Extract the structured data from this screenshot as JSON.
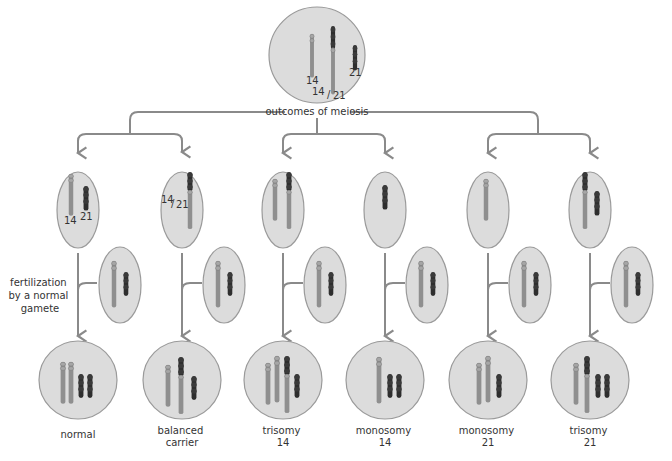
{
  "title_label": "outcomes of meiosis",
  "fertilization_label": [
    "fertilization",
    "by a normal",
    "gamete"
  ],
  "colors": {
    "cell_fill": "#dcdcdc",
    "cell_stroke": "#9a9a9a",
    "line": "#8a8a8a",
    "chrom14": "#8f8f8f",
    "chrom21": "#2e2e2e",
    "text": "#333333"
  },
  "parent_cell": {
    "labels": {
      "c14": "14",
      "c1421_a": "14",
      "c1421_b": "21",
      "c21": "21"
    }
  },
  "gametes": [
    {
      "id": "g1",
      "labels": [
        "14",
        "21"
      ]
    },
    {
      "id": "g2",
      "labels": [
        "14",
        "21"
      ]
    },
    {
      "id": "g3",
      "labels": []
    },
    {
      "id": "g4",
      "labels": []
    },
    {
      "id": "g5",
      "labels": []
    },
    {
      "id": "g6",
      "labels": []
    }
  ],
  "outcomes": [
    {
      "id": "normal",
      "line1": "normal",
      "line2": ""
    },
    {
      "id": "balanced-carrier",
      "line1": "balanced",
      "line2": "carrier"
    },
    {
      "id": "trisomy-14",
      "line1": "trisomy",
      "line2": "14"
    },
    {
      "id": "monosomy-14",
      "line1": "monosomy",
      "line2": "14"
    },
    {
      "id": "monosomy-21",
      "line1": "monosomy",
      "line2": "21"
    },
    {
      "id": "trisomy-21",
      "line1": "trisomy",
      "line2": "21"
    }
  ]
}
